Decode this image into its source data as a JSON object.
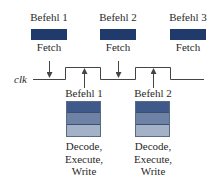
{
  "diagram": {
    "type": "pipeline-timing",
    "clock_label": "clk",
    "colors": {
      "fetch": "#1f3a6b",
      "stage_decode": "#3f5a8a",
      "stage_execute": "#6e82a6",
      "stage_write": "#a4b2c8",
      "line": "#444444"
    },
    "fetch_row": [
      {
        "instruction": "Befehl 1",
        "stage": "Fetch"
      },
      {
        "instruction": "Befehl 2",
        "stage": "Fetch"
      },
      {
        "instruction": "Befehl 3",
        "stage": "Fetch"
      }
    ],
    "execute_row": [
      {
        "instruction": "Befehl 1",
        "stage_lines": [
          "Decode,",
          "Execute,",
          "Write"
        ]
      },
      {
        "instruction": "Befehl 2",
        "stage_lines": [
          "Decode,",
          "Execute,",
          "Write"
        ]
      }
    ]
  }
}
